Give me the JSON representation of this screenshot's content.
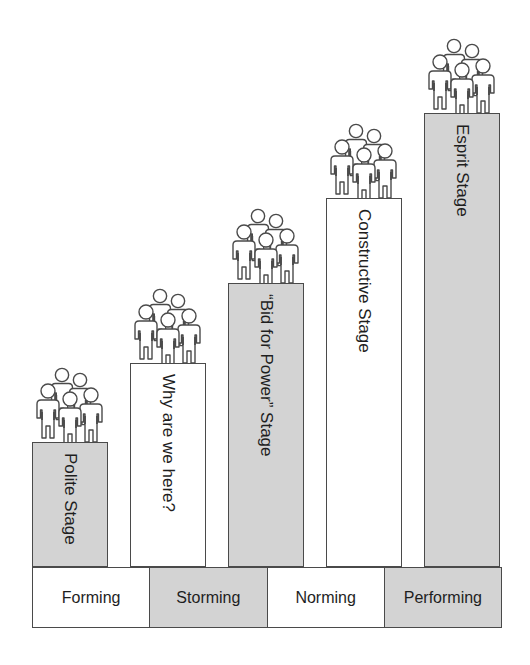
{
  "diagram": {
    "title": "",
    "stages": [
      {
        "label": "Polite Stage",
        "shaded": true,
        "level": 1,
        "icon": "group-of-people-icon"
      },
      {
        "label": "Why are we here?",
        "shaded": false,
        "level": 2,
        "icon": "group-of-people-icon"
      },
      {
        "label": "“Bid for Power” Stage",
        "shaded": true,
        "level": 3,
        "icon": "group-of-people-icon"
      },
      {
        "label": "Constructive Stage",
        "shaded": false,
        "level": 4,
        "icon": "group-of-people-icon"
      },
      {
        "label": "Esprit Stage",
        "shaded": true,
        "level": 5,
        "icon": "group-of-people-icon"
      }
    ],
    "phases": [
      {
        "label": "Forming",
        "shaded": false
      },
      {
        "label": "Storming",
        "shaded": true
      },
      {
        "label": "Norming",
        "shaded": false
      },
      {
        "label": "Performing",
        "shaded": true
      }
    ],
    "colors": {
      "shaded_fill": "#d3d3d3",
      "plain_fill": "#ffffff",
      "outline": "#4a4a4a",
      "text": "#1e1e1e"
    }
  }
}
